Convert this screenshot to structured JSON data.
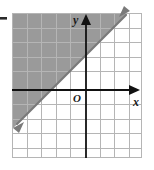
{
  "figure": {
    "name": "coordinate-plane-inequality-graph",
    "kind": "cartesian-grid-with-shaded-half-plane",
    "background_color": "#ffffff",
    "grid": {
      "line_color": "#b5b5b5",
      "cell_size_px": 14.6,
      "left_px": 12,
      "top_px": 13,
      "right_px": 142,
      "bottom_px": 158,
      "columns": 9,
      "rows": 10,
      "x_range": [
        -5,
        4
      ],
      "y_range": [
        -5,
        5
      ],
      "grid_on": true
    },
    "axes": {
      "color": "#111111",
      "x_axis": {
        "label": "x",
        "y_pixel": 90,
        "arrow": "right"
      },
      "y_axis": {
        "label": "y",
        "x_pixel": 86,
        "arrow": "up"
      },
      "origin": {
        "label": "O",
        "x_pixel": 86,
        "y_pixel": 90
      }
    },
    "boundary_line": {
      "name": "boundary-line",
      "slope": 1,
      "y_intercept": 2.5,
      "style": "solid",
      "color": "#7a7a7a",
      "arrows": "both",
      "x_intercept": -2.5
    },
    "shaded_region": {
      "name": "shaded-half-plane",
      "side": "above-left",
      "fill_color": "#9a9a9a",
      "description": "region above the boundary line"
    },
    "tick_mark": {
      "name": "left-edge-tick",
      "color": "#2b2b2b",
      "x_pixel": 2,
      "y_pixel": 18
    }
  }
}
